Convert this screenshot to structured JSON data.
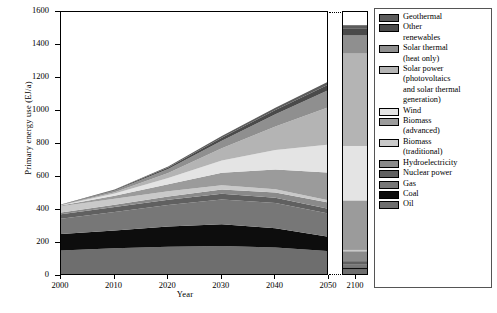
{
  "chart_data": {
    "type": "area",
    "title": "",
    "xlabel": "Year",
    "ylabel": "Primary energy use (EJ/a)",
    "ylim": [
      0,
      1600
    ],
    "ytick_labels": [
      "0",
      "200",
      "400",
      "600",
      "800",
      "1000",
      "1200",
      "1400",
      "1600"
    ],
    "yticks": [
      0,
      200,
      400,
      600,
      800,
      1000,
      1200,
      1400,
      1600
    ],
    "xtick_labels": [
      "2000",
      "2010",
      "2020",
      "2030",
      "2040",
      "2050"
    ],
    "xticks": [
      2000,
      2010,
      2020,
      2030,
      2040,
      2050
    ],
    "x": [
      2000,
      2010,
      2020,
      2030,
      2040,
      2050
    ],
    "broken_axis": true,
    "inset_panel_label": "2100",
    "grid": false,
    "legend_position": "right",
    "stack_order_bottom_to_top": [
      "Oil",
      "Coal",
      "Gas",
      "Nuclear power",
      "Hydroelectricity",
      "Biomass (traditional)",
      "Biomass (advanced)",
      "Wind",
      "Solar power (photovoltaics and solar thermal generation)",
      "Solar thermal (heat only)",
      "Other renewables",
      "Geothermal"
    ],
    "series": [
      {
        "name": "Oil",
        "color": "#6e6e6e",
        "values": [
          155,
          168,
          178,
          182,
          172,
          150
        ],
        "value_2100": 40
      },
      {
        "name": "Coal",
        "color": "#0d0d0d",
        "values": [
          100,
          108,
          122,
          132,
          118,
          88
        ],
        "value_2100": 12
      },
      {
        "name": "Gas",
        "color": "#777777",
        "values": [
          92,
          112,
          130,
          150,
          152,
          140
        ],
        "value_2100": 20
      },
      {
        "name": "Nuclear power",
        "color": "#606060",
        "values": [
          28,
          30,
          32,
          34,
          32,
          28
        ],
        "value_2100": 18
      },
      {
        "name": "Hydroelectricity",
        "color": "#8a8a8a",
        "values": [
          10,
          14,
          20,
          26,
          32,
          38
        ],
        "value_2100": 60
      },
      {
        "name": "Biomass (traditional)",
        "color": "#c9c9c9",
        "values": [
          38,
          36,
          32,
          26,
          20,
          14
        ],
        "value_2100": 8
      },
      {
        "name": "Biomass (advanced)",
        "color": "#9b9b9b",
        "values": [
          4,
          18,
          42,
          76,
          120,
          168
        ],
        "value_2100": 300
      },
      {
        "name": "Wind",
        "color": "#e4e4e4",
        "values": [
          2,
          14,
          38,
          74,
          118,
          170
        ],
        "value_2100": 330
      },
      {
        "name": "Solar power (photovoltaics and solar thermal generation)",
        "color": "#b4b4b4",
        "values": [
          1,
          8,
          30,
          74,
          142,
          228
        ],
        "value_2100": 560
      },
      {
        "name": "Solar thermal (heat only)",
        "color": "#8f8f8f",
        "values": [
          2,
          10,
          24,
          46,
          74,
          104
        ],
        "value_2100": 110
      },
      {
        "name": "Other renewables",
        "color": "#4a4a4a",
        "values": [
          1,
          4,
          10,
          18,
          26,
          34
        ],
        "value_2100": 40
      },
      {
        "name": "Geothermal",
        "color": "#5c5c5c",
        "values": [
          1,
          3,
          6,
          10,
          14,
          18
        ],
        "value_2100": 22
      }
    ],
    "total_2050": 1180,
    "total_2100": 1520
  },
  "legend": {
    "items": [
      {
        "label": "Geothermal",
        "label2": "",
        "color": "#5c5c5c"
      },
      {
        "label": "Other",
        "label2": "renewables",
        "color": "#4a4a4a"
      },
      {
        "label": "Solar thermal",
        "label2": "(heat only)",
        "color": "#8f8f8f"
      },
      {
        "label": "Solar power",
        "label2": "(photovoltaics",
        "label3": "and solar thermal",
        "label4": "generation)",
        "color": "#b4b4b4"
      },
      {
        "label": "Wind",
        "label2": "",
        "color": "#e4e4e4"
      },
      {
        "label": "Biomass",
        "label2": "(advanced)",
        "color": "#9b9b9b"
      },
      {
        "label": "Biomass",
        "label2": "(traditional)",
        "color": "#c9c9c9"
      },
      {
        "label": "Hydroelectricity",
        "label2": "",
        "color": "#8a8a8a"
      },
      {
        "label": "Nuclear power",
        "label2": "",
        "color": "#606060"
      },
      {
        "label": "Gas",
        "label2": "",
        "color": "#777777"
      },
      {
        "label": "Coal",
        "label2": "",
        "color": "#0d0d0d"
      },
      {
        "label": "Oil",
        "label2": "",
        "color": "#6e6e6e"
      }
    ]
  },
  "axes": {
    "y_title": "Primary energy use (EJ/a)",
    "x_title": "Year",
    "panel2100_label": "2100"
  }
}
